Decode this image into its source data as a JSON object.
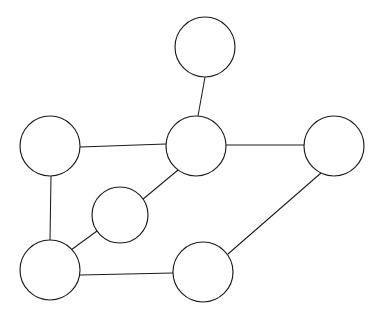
{
  "figure": {
    "type": "graph-diagram",
    "title": "",
    "background_color": "#ffffff",
    "stroke_color": "#1c1c1c",
    "text_color": "#141414",
    "width": 376,
    "height": 320
  },
  "nodes": [
    {
      "id": "top",
      "label": "r",
      "sub": "",
      "mirrored": true,
      "cx": 205,
      "cy": 47,
      "r": 30
    },
    {
      "id": "left",
      "label": "R",
      "sub": "",
      "mirrored": false,
      "cx": 50,
      "cy": 146,
      "r": 30
    },
    {
      "id": "center",
      "label": "r",
      "sub": "",
      "mirrored": true,
      "cx": 196,
      "cy": 146,
      "r": 30
    },
    {
      "id": "right",
      "label": "r",
      "sub": "o",
      "mirrored": true,
      "cx": 334,
      "cy": 146,
      "r": 30
    },
    {
      "id": "mid",
      "label": "J",
      "sub": "",
      "mirrored": true,
      "cx": 120,
      "cy": 215,
      "r": 28
    },
    {
      "id": "bottomleft",
      "label": "R",
      "sub": "",
      "mirrored": true,
      "cx": 50,
      "cy": 270,
      "r": 30
    },
    {
      "id": "bottommid",
      "label": "X",
      "sub": "",
      "mirrored": false,
      "cx": 203,
      "cy": 272,
      "r": 30
    }
  ],
  "edges": [
    {
      "id": "top-center",
      "from": "top",
      "to": "center",
      "x1": 205,
      "y1": 77,
      "x2": 198,
      "y2": 116
    },
    {
      "id": "left-center",
      "from": "left",
      "to": "center",
      "x1": 80,
      "y1": 147,
      "x2": 166,
      "y2": 144
    },
    {
      "id": "center-right",
      "from": "center",
      "to": "right",
      "x1": 226,
      "y1": 145,
      "x2": 304,
      "y2": 145
    },
    {
      "id": "left-bottomleft",
      "from": "left",
      "to": "bottomleft",
      "x1": 51,
      "y1": 176,
      "x2": 50,
      "y2": 240
    },
    {
      "id": "center-mid",
      "from": "center",
      "to": "mid",
      "x1": 178,
      "y1": 170,
      "x2": 142,
      "y2": 200
    },
    {
      "id": "mid-bottomleft",
      "from": "mid",
      "to": "bottomleft",
      "x1": 97,
      "y1": 231,
      "x2": 71,
      "y2": 250
    },
    {
      "id": "bottomleft-bottommid",
      "from": "bottomleft",
      "to": "bottommid",
      "x1": 80,
      "y1": 275,
      "x2": 173,
      "y2": 273
    },
    {
      "id": "bottommid-right",
      "from": "bottommid",
      "to": "right",
      "x1": 228,
      "y1": 254,
      "x2": 321,
      "y2": 173
    }
  ],
  "edge_labels": [
    {
      "id": "lbl-a2-top",
      "base": "a",
      "sub": "2",
      "x": 188,
      "y": 95
    },
    {
      "id": "lbl-a5-top",
      "base": "a",
      "sub": "5",
      "x": 213,
      "y": 95
    },
    {
      "id": "lbl-a1-left",
      "base": "a",
      "sub": "1",
      "x": 119,
      "y": 133
    },
    {
      "id": "lbl-a1-right",
      "base": "a",
      "sub": "1",
      "x": 265,
      "y": 132
    },
    {
      "id": "lbl-a3-vert",
      "base": "a",
      "sub": "3",
      "x": 33,
      "y": 205
    },
    {
      "id": "lbl-a5-vert",
      "base": "a",
      "sub": "5",
      "x": 59,
      "y": 205
    },
    {
      "id": "lbl-a3-diag",
      "base": "a",
      "sub": "3",
      "x": 156,
      "y": 176
    },
    {
      "id": "lbl-a5-diag",
      "base": "a",
      "sub": "5",
      "x": 172,
      "y": 194
    },
    {
      "id": "lbl-a3-lower",
      "base": "a",
      "sub": "3",
      "x": 76,
      "y": 231
    },
    {
      "id": "lbl-a4-diag",
      "base": "a",
      "sub": "4",
      "x": 275,
      "y": 219
    },
    {
      "id": "lbl-a5-bottom",
      "base": "a",
      "sub": "5",
      "x": 118,
      "y": 288
    }
  ]
}
